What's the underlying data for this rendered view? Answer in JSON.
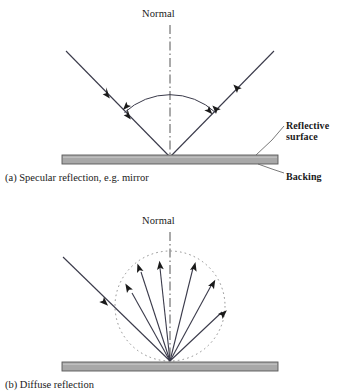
{
  "figure": {
    "background_color": "#ffffff",
    "line_color": "#3a3a4a",
    "surface_fill": "#a8a8a8",
    "surface_stroke": "#555555",
    "width": 340,
    "height": 387
  },
  "panel_a": {
    "id": "a",
    "caption": "(a) Specular reflection, e.g. mirror",
    "normal_label": "Normal",
    "callouts": {
      "reflective_surface": "Reflective\nsurface",
      "reflective_surface_line1": "Reflective",
      "reflective_surface_line2": "surface",
      "backing": "Backing"
    },
    "geometry": {
      "vertex": [
        170,
        157
      ],
      "incident_start": [
        66,
        51
      ],
      "reflected_end": [
        274,
        51
      ],
      "normal_top": [
        170,
        25
      ],
      "normal_bottom": [
        170,
        157
      ],
      "angle_arc_radius": 68,
      "surface_bar": {
        "x": 62,
        "y": 155,
        "width": 216,
        "height": 9
      },
      "incident_arrow_positions": [
        0.52,
        0.74
      ],
      "reflected_arrow_positions": [
        0.52,
        0.74
      ]
    }
  },
  "panel_b": {
    "id": "b",
    "caption": "(b) Diffuse reflection",
    "normal_label": "Normal",
    "geometry": {
      "vertex": [
        170,
        361
      ],
      "incident_start": [
        63,
        257
      ],
      "normal_top": [
        170,
        232
      ],
      "normal_bottom": [
        170,
        361
      ],
      "scatter_circle": {
        "cx": 170,
        "cy": 306,
        "r": 55,
        "style": "dotted"
      },
      "surface_bar": {
        "x": 62,
        "y": 362,
        "width": 216,
        "height": 9
      },
      "scattered_ray_angles_deg": [
        148,
        117,
        96,
        70,
        48,
        28
      ],
      "scattered_ray_count": 6
    }
  },
  "colors": {
    "ink": "#1a1a1a",
    "ray": "#3a3a4a",
    "surface": "#a8a8a8",
    "dotted_circle": "#8a8a8a",
    "normal_line": "#555555"
  }
}
